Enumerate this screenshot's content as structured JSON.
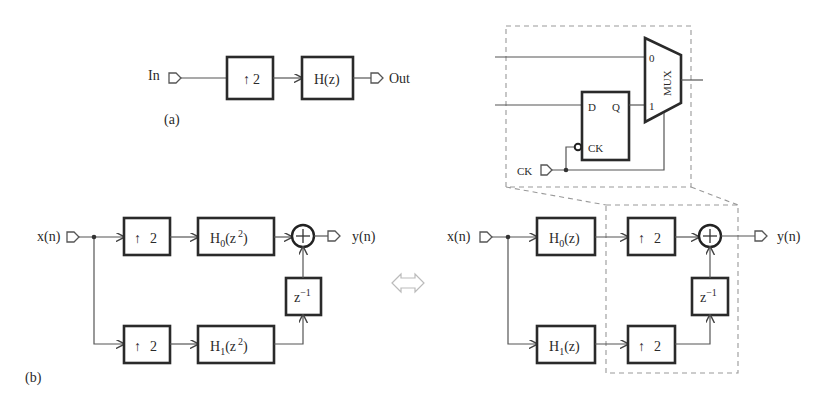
{
  "figure_a": {
    "label": "(a)",
    "input_label": "In",
    "output_label": "Out",
    "upsampler": {
      "arrow": "↑",
      "factor": "2"
    },
    "filter": {
      "text": "H(z)"
    }
  },
  "mux_detail": {
    "mux_label": "MUX",
    "input0": "0",
    "input1": "1",
    "flipflop": {
      "d": "D",
      "q": "Q",
      "ck": "CK"
    },
    "clock_input_label": "CK"
  },
  "figure_b": {
    "label": "(b)",
    "left": {
      "input_label": "x(n)",
      "output_label": "y(n)",
      "top_upsampler": {
        "arrow": "↑",
        "factor": "2"
      },
      "bottom_upsampler": {
        "arrow": "↑",
        "factor": "2"
      },
      "top_filter": {
        "base": "H",
        "sub": "0",
        "arg_open": "(z",
        "sup": "2",
        "arg_close": ")"
      },
      "bottom_filter": {
        "base": "H",
        "sub": "1",
        "arg_open": "(z",
        "sup": "2",
        "arg_close": ")"
      },
      "delay": {
        "base": "z",
        "sup": "−1"
      },
      "adder": "+"
    },
    "equivalence_symbol": "⇔",
    "right": {
      "input_label": "x(n)",
      "output_label": "y(n)",
      "top_filter": {
        "base": "H",
        "sub": "0",
        "arg": "(z)"
      },
      "bottom_filter": {
        "base": "H",
        "sub": "1",
        "arg": "(z)"
      },
      "top_upsampler": {
        "arrow": "↑",
        "factor": "2"
      },
      "bottom_upsampler": {
        "arrow": "↑",
        "factor": "2"
      },
      "delay": {
        "base": "z",
        "sup": "−1"
      },
      "adder": "+"
    }
  }
}
